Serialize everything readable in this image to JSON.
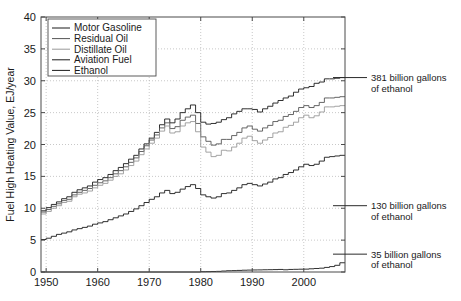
{
  "chart_data": {
    "type": "line",
    "title": "",
    "xlabel": "",
    "ylabel": "Fuel High Heating Value, EJ/year",
    "xlim": [
      1949,
      2008
    ],
    "ylim": [
      0,
      40
    ],
    "xticks": [
      1950,
      1960,
      1970,
      1980,
      1990,
      2000
    ],
    "yticks": [
      0,
      5,
      10,
      15,
      20,
      25,
      30,
      35,
      40
    ],
    "grid": true,
    "drawstyle": "steps-post",
    "legend_position": "upper left",
    "series": [
      {
        "name": "Motor Gasoline",
        "color": "#1a1a1a",
        "x": [
          1949,
          1950,
          1951,
          1952,
          1953,
          1954,
          1955,
          1956,
          1957,
          1958,
          1959,
          1960,
          1961,
          1962,
          1963,
          1964,
          1965,
          1966,
          1967,
          1968,
          1969,
          1970,
          1971,
          1972,
          1973,
          1974,
          1975,
          1976,
          1977,
          1978,
          1979,
          1980,
          1981,
          1982,
          1983,
          1984,
          1985,
          1986,
          1987,
          1988,
          1989,
          1990,
          1991,
          1992,
          1993,
          1994,
          1995,
          1996,
          1997,
          1998,
          1999,
          2000,
          2001,
          2002,
          2003,
          2004,
          2005,
          2006,
          2007
        ],
        "values": [
          9.6,
          10.1,
          10.6,
          11.0,
          11.5,
          11.8,
          12.5,
          12.9,
          13.2,
          13.5,
          14.1,
          14.5,
          14.8,
          15.3,
          15.9,
          16.4,
          17.0,
          17.7,
          18.3,
          19.3,
          20.1,
          21.0,
          21.9,
          23.1,
          24.0,
          23.4,
          24.0,
          25.0,
          25.6,
          26.2,
          25.0,
          23.5,
          23.2,
          23.3,
          23.5,
          23.9,
          24.2,
          24.8,
          25.2,
          25.6,
          25.6,
          25.5,
          25.1,
          25.6,
          26.0,
          26.5,
          26.9,
          27.3,
          27.6,
          28.2,
          28.7,
          28.9,
          29.1,
          29.6,
          29.8,
          30.3,
          30.3,
          30.4,
          30.5
        ]
      },
      {
        "name": "Residual Oil",
        "color": "#555555",
        "x": [
          1949,
          1950,
          1951,
          1952,
          1953,
          1954,
          1955,
          1956,
          1957,
          1958,
          1959,
          1960,
          1961,
          1962,
          1963,
          1964,
          1965,
          1966,
          1967,
          1968,
          1969,
          1970,
          1971,
          1972,
          1973,
          1974,
          1975,
          1976,
          1977,
          1978,
          1979,
          1980,
          1981,
          1982,
          1983,
          1984,
          1985,
          1986,
          1987,
          1988,
          1989,
          1990,
          1991,
          1992,
          1993,
          1994,
          1995,
          1996,
          1997,
          1998,
          1999,
          2000,
          2001,
          2002,
          2003,
          2004,
          2005,
          2006,
          2007
        ],
        "values": [
          9.4,
          9.8,
          10.3,
          10.7,
          11.2,
          11.4,
          12.1,
          12.5,
          12.8,
          13.1,
          13.6,
          14.0,
          14.3,
          14.8,
          15.4,
          15.9,
          16.5,
          17.2,
          17.9,
          18.9,
          19.8,
          20.7,
          21.5,
          22.6,
          23.4,
          22.5,
          22.8,
          23.8,
          24.3,
          24.6,
          23.3,
          21.2,
          20.5,
          19.9,
          20.1,
          20.8,
          20.8,
          21.4,
          21.9,
          22.6,
          22.9,
          22.4,
          22.1,
          22.6,
          23.0,
          23.6,
          23.8,
          24.4,
          24.7,
          25.2,
          25.8,
          26.1,
          25.8,
          26.1,
          26.6,
          27.3,
          27.3,
          27.4,
          27.5
        ]
      },
      {
        "name": "Distillate Oil",
        "color": "#999999",
        "x": [
          1949,
          1950,
          1951,
          1952,
          1953,
          1954,
          1955,
          1956,
          1957,
          1958,
          1959,
          1960,
          1961,
          1962,
          1963,
          1964,
          1965,
          1966,
          1967,
          1968,
          1969,
          1970,
          1971,
          1972,
          1973,
          1974,
          1975,
          1976,
          1977,
          1978,
          1979,
          1980,
          1981,
          1982,
          1983,
          1984,
          1985,
          1986,
          1987,
          1988,
          1989,
          1990,
          1991,
          1992,
          1993,
          1994,
          1995,
          1996,
          1997,
          1998,
          1999,
          2000,
          2001,
          2002,
          2003,
          2004,
          2005,
          2006,
          2007
        ],
        "values": [
          9.1,
          9.5,
          10.0,
          10.4,
          10.9,
          11.1,
          11.8,
          12.2,
          12.4,
          12.7,
          13.2,
          13.6,
          13.9,
          14.4,
          15.0,
          15.4,
          16.0,
          16.7,
          17.4,
          18.4,
          19.3,
          20.2,
          21.0,
          22.1,
          22.9,
          21.8,
          22.0,
          22.9,
          23.4,
          23.6,
          22.0,
          19.6,
          18.8,
          18.1,
          18.3,
          19.1,
          19.0,
          19.6,
          20.2,
          21.0,
          21.3,
          20.6,
          20.2,
          20.7,
          21.1,
          21.8,
          22.0,
          22.7,
          23.0,
          23.5,
          24.2,
          24.6,
          24.2,
          24.5,
          25.1,
          25.9,
          25.9,
          26.0,
          26.1
        ]
      },
      {
        "name": "Aviation Fuel",
        "color": "#1a1a1a",
        "x": [
          1949,
          1950,
          1951,
          1952,
          1953,
          1954,
          1955,
          1956,
          1957,
          1958,
          1959,
          1960,
          1961,
          1962,
          1963,
          1964,
          1965,
          1966,
          1967,
          1968,
          1969,
          1970,
          1971,
          1972,
          1973,
          1974,
          1975,
          1976,
          1977,
          1978,
          1979,
          1980,
          1981,
          1982,
          1983,
          1984,
          1985,
          1986,
          1987,
          1988,
          1989,
          1990,
          1991,
          1992,
          1993,
          1994,
          1995,
          1996,
          1997,
          1998,
          1999,
          2000,
          2001,
          2002,
          2003,
          2004,
          2005,
          2006,
          2007
        ],
        "values": [
          5.1,
          5.3,
          5.6,
          5.9,
          6.1,
          6.3,
          6.6,
          6.8,
          7.0,
          7.2,
          7.5,
          7.7,
          7.9,
          8.2,
          8.5,
          8.8,
          9.1,
          9.5,
          9.9,
          10.4,
          10.9,
          11.4,
          11.8,
          12.4,
          12.8,
          12.3,
          12.5,
          13.0,
          13.4,
          13.7,
          13.1,
          12.1,
          11.8,
          11.6,
          11.8,
          12.3,
          12.4,
          12.8,
          13.2,
          13.7,
          13.9,
          13.7,
          13.5,
          13.8,
          14.1,
          14.6,
          14.8,
          15.3,
          15.6,
          16.0,
          16.5,
          16.9,
          16.7,
          16.9,
          17.4,
          18.0,
          18.1,
          18.2,
          18.3
        ]
      },
      {
        "name": "Ethanol",
        "color": "#1a1a1a",
        "x": [
          1949,
          1960,
          1970,
          1975,
          1980,
          1981,
          1982,
          1983,
          1984,
          1985,
          1986,
          1987,
          1988,
          1989,
          1990,
          1991,
          1992,
          1993,
          1994,
          1995,
          1996,
          1997,
          1998,
          1999,
          2000,
          2001,
          2002,
          2003,
          2004,
          2005,
          2006,
          2007
        ],
        "values": [
          0.0,
          0.0,
          0.0,
          0.0,
          0.05,
          0.06,
          0.08,
          0.1,
          0.15,
          0.2,
          0.22,
          0.25,
          0.28,
          0.3,
          0.32,
          0.33,
          0.35,
          0.36,
          0.38,
          0.4,
          0.35,
          0.4,
          0.42,
          0.44,
          0.45,
          0.5,
          0.55,
          0.6,
          0.72,
          0.85,
          1.05,
          1.45
        ]
      }
    ],
    "annotations": [
      {
        "text_line1": "381 billion gallons",
        "text_line2": "of ethanol",
        "y": 30.5
      },
      {
        "text_line1": "130 billion gallons",
        "text_line2": "of ethanol",
        "y": 10.4
      },
      {
        "text_line1": "35 billion gallons",
        "text_line2": "of ethanol",
        "y": 2.8
      }
    ]
  },
  "legend": {
    "items": [
      {
        "label": "Motor Gasoline",
        "color": "#1a1a1a"
      },
      {
        "label": "Residual Oil",
        "color": "#555555"
      },
      {
        "label": "Distillate Oil",
        "color": "#999999"
      },
      {
        "label": "Aviation Fuel",
        "color": "#1a1a1a"
      },
      {
        "label": "Ethanol",
        "color": "#1a1a1a"
      }
    ]
  }
}
